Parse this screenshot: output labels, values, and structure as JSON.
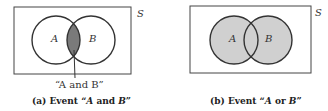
{
  "panels": [
    {
      "caption_prefix": "(a)  Event “",
      "caption_italic_1": "A",
      "caption_mid": " and ",
      "caption_italic_2": "B",
      "caption_suffix": "”",
      "universe_label": "S",
      "set_a_label": "A",
      "set_b_label": "B",
      "callout_label": "“A and B”",
      "shaded_region": "intersection"
    },
    {
      "caption_prefix": "(b)  Event “",
      "caption_italic_1": "A",
      "caption_mid": " or ",
      "caption_italic_2": "B",
      "caption_suffix": "”",
      "universe_label": "S",
      "set_a_label": "A",
      "set_b_label": "B",
      "shaded_region": "union"
    }
  ],
  "colors": {
    "shade_intersection": "#7a7a7a",
    "shade_union": "#d0d0d0",
    "stroke": "#333333"
  }
}
